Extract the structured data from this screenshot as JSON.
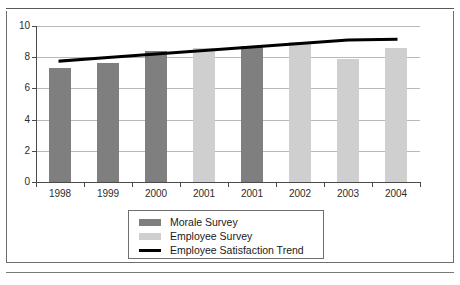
{
  "chart_data": {
    "type": "bar",
    "title": "",
    "xlabel": "",
    "ylabel": "",
    "categories": [
      "1998",
      "1999",
      "2000",
      "2001",
      "2001",
      "2002",
      "2003",
      "2004"
    ],
    "ylim": [
      0,
      10
    ],
    "yticks": [
      0,
      2,
      4,
      6,
      8,
      10
    ],
    "ytick_labels": [
      "0",
      "2",
      "4",
      "6",
      "8",
      "10"
    ],
    "grid": true,
    "legend_position": "below-center",
    "series": [
      {
        "name": "Morale Survey",
        "color": "#7f7f7f",
        "type": "bar",
        "values": [
          7.3,
          7.6,
          8.4,
          null,
          8.7,
          null,
          null,
          null
        ]
      },
      {
        "name": "Employee Survey",
        "color": "#cfcfcf",
        "type": "bar",
        "values": [
          null,
          null,
          null,
          8.6,
          null,
          9.0,
          7.9,
          8.6
        ]
      },
      {
        "name": "Employee Satisfaction Trend",
        "color": "#000000",
        "type": "line",
        "values": [
          7.75,
          7.98,
          8.2,
          8.43,
          8.65,
          8.88,
          9.1,
          9.15
        ]
      }
    ]
  },
  "legend": {
    "items": [
      {
        "label": "Morale Survey",
        "swatch": "bar",
        "color": "#7f7f7f"
      },
      {
        "label": "Employee Survey",
        "swatch": "bar",
        "color": "#cfcfcf"
      },
      {
        "label": "Employee Satisfaction Trend",
        "swatch": "line",
        "color": "#000000"
      }
    ]
  },
  "colors": {
    "morale_bar": "#7f7f7f",
    "employee_bar": "#cfcfcf",
    "trend_line": "#000000",
    "gridline": "#b9b9b9",
    "axis": "#4a4a4a",
    "frame": "#6e6e6e",
    "background": "#ffffff"
  }
}
